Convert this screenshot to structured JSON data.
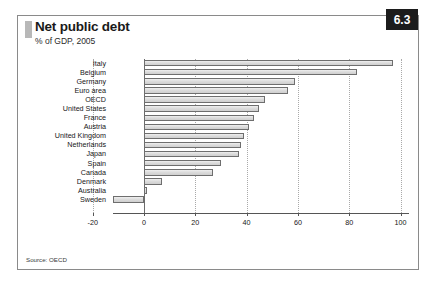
{
  "figure": {
    "number": "6.3",
    "title": "Net public debt",
    "subtitle": "% of GDP, 2005",
    "source": "Source: OECD"
  },
  "chart_data": {
    "type": "bar",
    "orientation": "horizontal",
    "title": "Net public debt",
    "subtitle": "% of GDP, 2005",
    "xlabel": "",
    "ylabel": "",
    "xlim": [
      -20,
      105
    ],
    "xticks": [
      -20,
      0,
      20,
      40,
      60,
      80,
      100
    ],
    "xticklabels": [
      "-20",
      "0",
      "20",
      "40",
      "60",
      "80",
      "100"
    ],
    "grid": "vertical-dotted",
    "legend": "none",
    "categories": [
      "Italy",
      "Belgium",
      "Germany",
      "Euro area",
      "OECD",
      "United States",
      "France",
      "Austria",
      "United Kingdom",
      "Netherlands",
      "Japan",
      "Spain",
      "Canada",
      "Denmark",
      "Australia",
      "Sweden"
    ],
    "values": [
      97,
      83,
      59,
      56,
      47,
      45,
      43,
      41,
      39,
      38,
      37,
      30,
      27,
      7,
      1,
      -12
    ],
    "bar_fill": "#dcdcdc",
    "bar_edge": "#6e6e6e"
  },
  "colors": {
    "badge_background": "#1c1c1c",
    "badge_text": "#ffffff",
    "frame_border": "#8a8a8a",
    "accent_bar": "#b8b8b8",
    "axis": "#555555",
    "gridline": "#a9a9a9"
  }
}
